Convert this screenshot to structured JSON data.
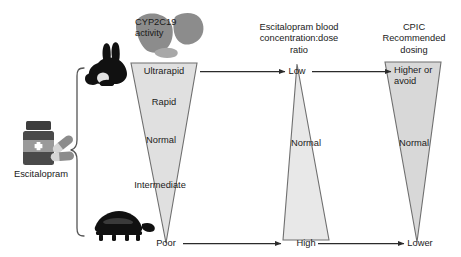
{
  "figure": {
    "title_present": false,
    "background": "#ffffff",
    "columns": [
      {
        "id": "cyp",
        "heading": "CYP2C19\nactivity"
      },
      {
        "id": "conc",
        "heading": "Escitalopram blood\nconcentration:dose\nratio"
      },
      {
        "id": "dosing",
        "heading": "CPIC\nRecommended\ndosing"
      }
    ]
  },
  "drug": {
    "label": "Escitalopram",
    "bottle_icon": "pill-bottle-icon",
    "capsule_icon": "capsule-icon",
    "cross_symbol": "+"
  },
  "speed_icons": {
    "fast": {
      "name": "rabbit-icon",
      "meaning": "fast metabolism"
    },
    "slow": {
      "name": "turtle-icon",
      "meaning": "slow metabolism"
    }
  },
  "triangles": [
    {
      "id": "cyp2c19-activity",
      "orientation": "wide-top",
      "labels": [
        "Ultrarapid",
        "Rapid",
        "Normal",
        "Intermediate",
        "Poor"
      ]
    },
    {
      "id": "blood-concentration",
      "orientation": "narrow-top",
      "labels": [
        "Low",
        "Normal",
        "High"
      ]
    },
    {
      "id": "cpic-dosing",
      "orientation": "wide-top",
      "labels": [
        "Higher or\navoid",
        "Normal",
        "Lower"
      ]
    }
  ],
  "arrows": [
    {
      "id": "arrow-ultrarapid-to-low",
      "from": "Ultrarapid",
      "to": "Low"
    },
    {
      "id": "arrow-low-to-higher",
      "from": "Low",
      "to": "Higher or avoid"
    },
    {
      "id": "arrow-poor-to-high",
      "from": "Poor",
      "to": "High"
    },
    {
      "id": "arrow-high-to-lower",
      "from": "High",
      "to": "Lower"
    }
  ],
  "colors": {
    "triangle_fill": "#e0e0e0",
    "triangle_stroke": "#6f6f6f",
    "liver": "#8c8c8c",
    "icon_dark": "#111111",
    "bottle_cap": "#3d3d3d",
    "bottle_body": "#4a4a4a",
    "bottle_band": "#9a9a9a",
    "capsule_light": "#d6d6d6",
    "capsule_dark": "#8c8c8c",
    "arrow": "#2b2b2b",
    "brace": "#555555",
    "text": "#1a1a1a"
  }
}
